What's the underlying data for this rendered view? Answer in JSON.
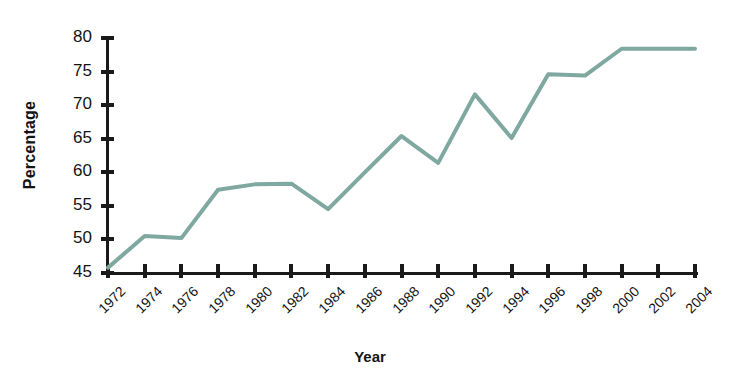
{
  "chart_data": {
    "type": "line",
    "title": "",
    "xlabel": "Year",
    "ylabel": "Percentage",
    "xlim": [
      1972,
      2004
    ],
    "ylim": [
      45,
      80
    ],
    "grid": false,
    "legend": null,
    "line_color": "#7FA8A0",
    "axis_color": "#1a1a1a",
    "xticks": [
      1972,
      1974,
      1976,
      1978,
      1980,
      1982,
      1984,
      1986,
      1988,
      1990,
      1992,
      1994,
      1996,
      1998,
      2000,
      2002,
      2004
    ],
    "xticklabels": [
      "1972",
      "1974",
      "1976",
      "1978",
      "1980",
      "1982",
      "1984",
      "1986",
      "1988",
      "1990",
      "1992",
      "1994",
      "1996",
      "1998",
      "2000",
      "2002",
      "2004"
    ],
    "yticks": [
      45,
      50,
      55,
      60,
      65,
      70,
      75,
      80
    ],
    "yticklabels": [
      "45",
      "50",
      "55",
      "60",
      "65",
      "70",
      "75",
      "80"
    ],
    "x": [
      1972,
      1974,
      1976,
      1978,
      1980,
      1982,
      1984,
      1986,
      1988,
      1990,
      1992,
      1994,
      1996,
      1998,
      2000,
      2002,
      2004
    ],
    "values": [
      45.8,
      50.5,
      50.2,
      57.4,
      58.2,
      58.3,
      54.5,
      60.0,
      65.4,
      61.4,
      71.6,
      65.1,
      74.6,
      74.4,
      78.4,
      78.4,
      78.4
    ],
    "series": [
      {
        "name": "Percentage",
        "values": [
          45.8,
          50.5,
          50.2,
          57.4,
          58.2,
          58.3,
          54.5,
          60.0,
          65.4,
          61.4,
          71.6,
          65.1,
          74.6,
          74.4,
          78.4,
          78.4,
          78.4
        ]
      }
    ]
  }
}
